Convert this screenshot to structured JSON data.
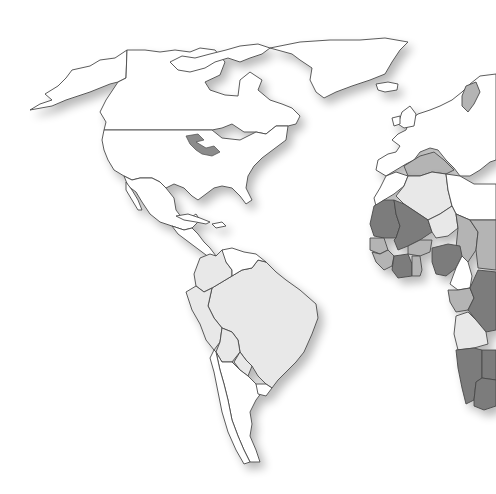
{
  "map": {
    "type": "choropleth-world-map",
    "style": "grayscale",
    "colors": {
      "background": "#ffffff",
      "no_data": "#ffffff",
      "light": "#e8e8e8",
      "medium": "#b4b4b4",
      "dark": "#7c7c7c",
      "outline": "#4a4a4a",
      "shadow": "#d8d8d8"
    },
    "regions": [
      {
        "id": "alaska",
        "shade": "no_data"
      },
      {
        "id": "canada",
        "shade": "no_data"
      },
      {
        "id": "usa",
        "shade": "no_data"
      },
      {
        "id": "greenland",
        "shade": "no_data"
      },
      {
        "id": "iceland",
        "shade": "no_data"
      },
      {
        "id": "mexico",
        "shade": "no_data"
      },
      {
        "id": "central-america",
        "shade": "no_data"
      },
      {
        "id": "cuba",
        "shade": "no_data"
      },
      {
        "id": "brazil",
        "shade": "light"
      },
      {
        "id": "colombia",
        "shade": "light"
      },
      {
        "id": "venezuela",
        "shade": "no_data"
      },
      {
        "id": "peru",
        "shade": "light"
      },
      {
        "id": "bolivia",
        "shade": "light"
      },
      {
        "id": "paraguay",
        "shade": "light"
      },
      {
        "id": "argentina",
        "shade": "no_data"
      },
      {
        "id": "chile",
        "shade": "no_data"
      },
      {
        "id": "uruguay",
        "shade": "no_data"
      },
      {
        "id": "europe",
        "shade": "no_data"
      },
      {
        "id": "sweden",
        "shade": "medium"
      },
      {
        "id": "mediterranean-sea",
        "shade": "medium"
      },
      {
        "id": "morocco",
        "shade": "no_data"
      },
      {
        "id": "algeria",
        "shade": "light"
      },
      {
        "id": "mauritania",
        "shade": "dark"
      },
      {
        "id": "mali",
        "shade": "dark"
      },
      {
        "id": "niger",
        "shade": "light"
      },
      {
        "id": "senegal",
        "shade": "medium"
      },
      {
        "id": "guinea",
        "shade": "medium"
      },
      {
        "id": "burkina-faso",
        "shade": "medium"
      },
      {
        "id": "cote-divoire",
        "shade": "dark"
      },
      {
        "id": "ghana",
        "shade": "medium"
      },
      {
        "id": "nigeria",
        "shade": "dark"
      },
      {
        "id": "chad",
        "shade": "medium"
      },
      {
        "id": "cameroon",
        "shade": "no_data"
      },
      {
        "id": "gabon",
        "shade": "medium"
      },
      {
        "id": "drc",
        "shade": "dark"
      },
      {
        "id": "angola",
        "shade": "light"
      },
      {
        "id": "namibia",
        "shade": "dark"
      },
      {
        "id": "botswana",
        "shade": "dark"
      },
      {
        "id": "south-africa",
        "shade": "dark"
      }
    ]
  }
}
